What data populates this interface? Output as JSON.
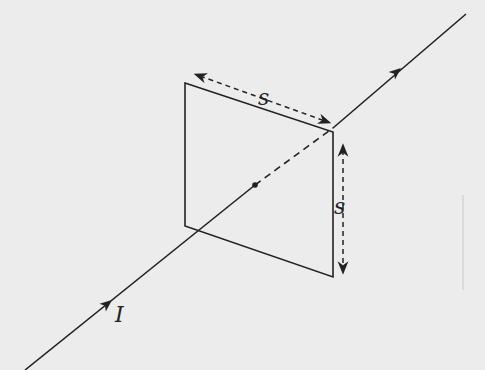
{
  "diagram": {
    "wire": {
      "current_label": "I",
      "direction": "up-right"
    },
    "square_loop": {
      "side_label_top": "s",
      "side_label_right": "s"
    },
    "colors": {
      "background": "#ececec",
      "ink": "#222222"
    }
  }
}
